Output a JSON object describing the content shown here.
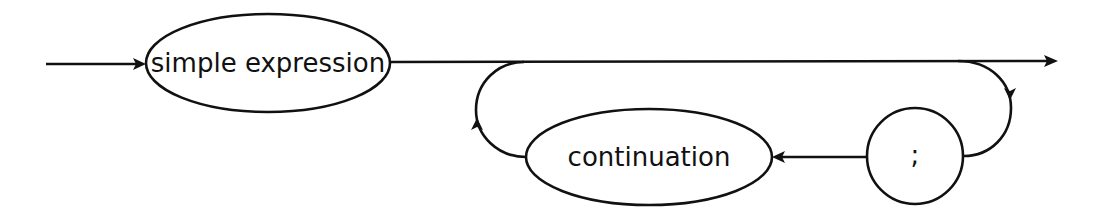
{
  "diagram": {
    "type": "syntax-diagram",
    "colors": {
      "stroke": "#111111",
      "background": "#ffffff"
    },
    "nodes": [
      {
        "id": "simple-expression",
        "kind": "nonterminal",
        "label": "simple expression"
      },
      {
        "id": "continuation",
        "kind": "nonterminal",
        "label": "continuation"
      },
      {
        "id": "semicolon",
        "kind": "terminal",
        "label": ";"
      }
    ],
    "edges": [
      {
        "from": "entry",
        "to": "simple-expression"
      },
      {
        "from": "simple-expression",
        "to": "exit"
      },
      {
        "from": "simple-expression",
        "to": "semicolon",
        "note": "branch from main line loops down into ';'"
      },
      {
        "from": "semicolon",
        "to": "continuation"
      },
      {
        "from": "continuation",
        "to": "main-line",
        "note": "loops back up to main line"
      }
    ]
  }
}
